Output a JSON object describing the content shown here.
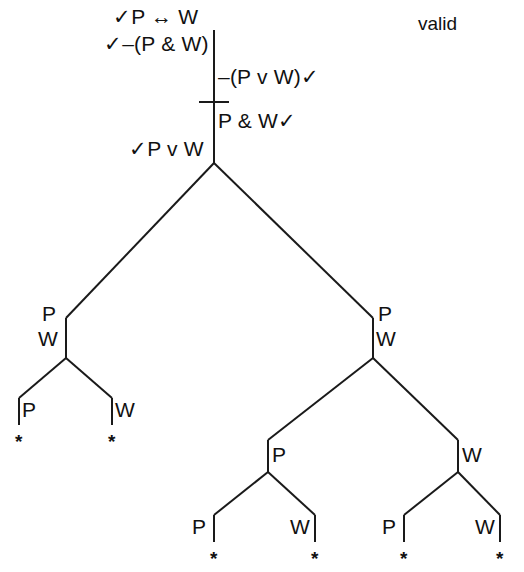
{
  "figure": {
    "type": "semantic-tableau-truth-tree",
    "verdict": "valid",
    "background_color": "#ffffff",
    "ink_color": "#111111"
  },
  "root_stack": {
    "premise_1": "✓P ↔ W",
    "premise_2": "✓–(P & W)",
    "negated_conclusion": "–(P v W)✓",
    "derived_1": "P & W✓",
    "derived_2": "✓P v W"
  },
  "checks": {
    "check_mark": "✓",
    "star_mark": "*"
  },
  "branch_labels": {
    "left_node_upper": "P",
    "left_node_lower": "W",
    "right_node_upper": "P",
    "right_node_lower": "W",
    "right_mid_left": "P",
    "right_mid_right": "W",
    "leaf_1": "P",
    "leaf_2": "W",
    "leaf_3": "P",
    "leaf_4": "W",
    "leaf_5": "P",
    "leaf_6": "W"
  },
  "closures": {
    "leaf_1_star": "*",
    "leaf_2_star": "*",
    "leaf_3_star": "*",
    "leaf_4_star": "*",
    "leaf_5_star": "*",
    "leaf_6_star": "*"
  }
}
